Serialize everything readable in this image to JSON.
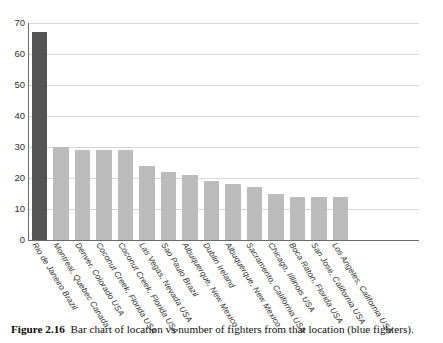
{
  "figure": {
    "caption_label": "Figure 2.16",
    "caption_text": "Bar chart of location vs number of fighters from that location (blue fighters)."
  },
  "colors": {
    "highlight_bar": "#545454",
    "normal_bar": "#bcbcbc",
    "gridline": "#d8d8d8",
    "axis": "#6a6a6a",
    "background": "#ffffff"
  },
  "chart_data": {
    "type": "bar",
    "title": "",
    "xlabel": "",
    "ylabel": "",
    "ylim": [
      0,
      70
    ],
    "yticks": [
      0,
      10,
      20,
      30,
      40,
      50,
      60,
      70
    ],
    "grid": true,
    "legend": null,
    "categories": [
      "Rio de Janeiro Brazil",
      "Montreal, Quebec Canada",
      "Denver, Colorado USA",
      "Coconut Creek, Florida USA",
      "Coconut Creek, Florida USA",
      "Las Vegas, Nevada USA",
      "Sao Paulo Brazil",
      "Albuquerque, New Mexico",
      "Dublin Ireland",
      "Albuquerque, New Mexico",
      "Sacramento, California USA",
      "Chicago, Illlinois USA",
      "Boca Raton, Florida USA",
      "San Jose, California USA",
      "Los Angeles, California USA"
    ],
    "values": [
      67,
      30,
      29,
      29,
      29,
      24,
      22,
      21,
      19,
      18,
      17,
      15,
      14,
      14,
      14
    ],
    "highlight_index": 0
  }
}
